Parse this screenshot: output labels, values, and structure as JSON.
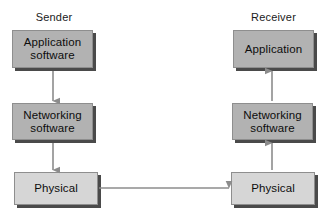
{
  "diagram": {
    "type": "block-flow",
    "colors": {
      "box_fill_dark": "#b2b2b2",
      "box_fill_light": "#d6d6d6",
      "box_border": "#8e8e8e",
      "box_shadow": "#4a4a4a",
      "arrow": "#8c8c8c",
      "text": "#0d0d0d",
      "background": "#ffffff"
    },
    "columns": [
      {
        "id": "sender",
        "title": "Sender",
        "flow_direction": "down",
        "nodes": [
          {
            "id": "sender-application",
            "label": "Application software",
            "shade": "dark"
          },
          {
            "id": "sender-networking",
            "label": "Networking software",
            "shade": "dark"
          },
          {
            "id": "sender-physical",
            "label": "Physical",
            "shade": "light"
          }
        ]
      },
      {
        "id": "receiver",
        "title": "Receiver",
        "flow_direction": "up",
        "nodes": [
          {
            "id": "receiver-application",
            "label": "Application",
            "shade": "dark"
          },
          {
            "id": "receiver-networking",
            "label": "Networking software",
            "shade": "dark"
          },
          {
            "id": "receiver-physical",
            "label": "Physical",
            "shade": "light"
          }
        ]
      }
    ],
    "connectors": [
      {
        "id": "sender-app-to-net",
        "from": "sender-application",
        "to": "sender-networking",
        "direction": "down"
      },
      {
        "id": "sender-net-to-phys",
        "from": "sender-networking",
        "to": "sender-physical",
        "direction": "down"
      },
      {
        "id": "physical-link",
        "from": "sender-physical",
        "to": "receiver-physical",
        "direction": "right"
      },
      {
        "id": "receiver-phys-to-net",
        "from": "receiver-physical",
        "to": "receiver-networking",
        "direction": "up"
      },
      {
        "id": "receiver-net-to-app",
        "from": "receiver-networking",
        "to": "receiver-application",
        "direction": "up"
      }
    ]
  }
}
